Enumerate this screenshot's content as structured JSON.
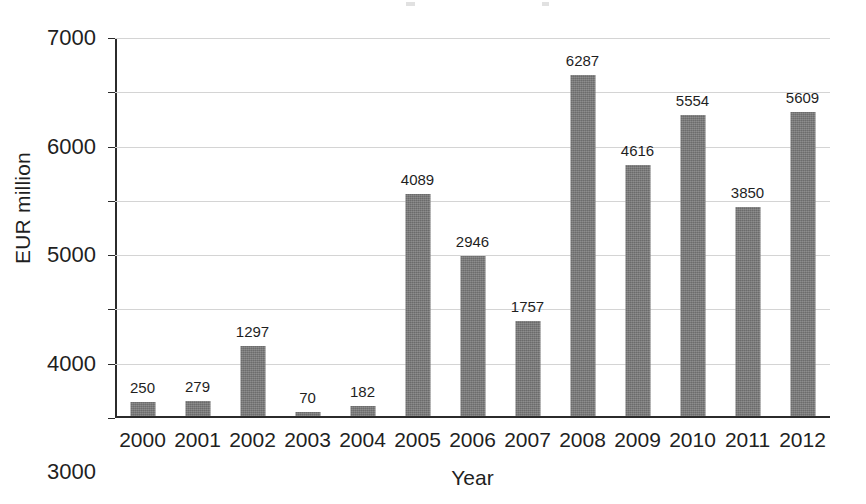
{
  "chart_data": {
    "type": "bar",
    "title": "",
    "xlabel": "Year",
    "ylabel": "EUR million",
    "categories": [
      "2000",
      "2001",
      "2002",
      "2003",
      "2004",
      "2005",
      "2006",
      "2007",
      "2008",
      "2009",
      "2010",
      "2011",
      "2012"
    ],
    "values": [
      250,
      279,
      1297,
      70,
      182,
      4089,
      2946,
      1757,
      6287,
      4616,
      5554,
      3850,
      5609
    ],
    "data_labels": [
      "250",
      "279",
      "1297",
      "70",
      "182",
      "4089",
      "2946",
      "1757",
      "6287",
      "4616",
      "5554",
      "3850",
      "5609"
    ],
    "ylim": [
      0,
      7000
    ],
    "ytick_labels": [
      "0",
      "1000",
      "2000",
      "3000",
      "4000",
      "5000",
      "6000",
      "7000"
    ],
    "ytick_values": [
      0,
      1000,
      2000,
      3000,
      4000,
      5000,
      6000,
      7000
    ],
    "grid": true,
    "grid_axis": "y",
    "legend": false,
    "legend_position": "none",
    "series": [
      {
        "name": "EUR million",
        "values": [
          250,
          279,
          1297,
          70,
          182,
          4089,
          2946,
          1757,
          6287,
          4616,
          5554,
          3850,
          5609
        ]
      }
    ],
    "colors": {
      "bar_fill": "#767676",
      "axis": "#2b2b2b",
      "gridline": "#d4d4d4",
      "text": "#1f1f1f",
      "background": "#ffffff"
    }
  }
}
